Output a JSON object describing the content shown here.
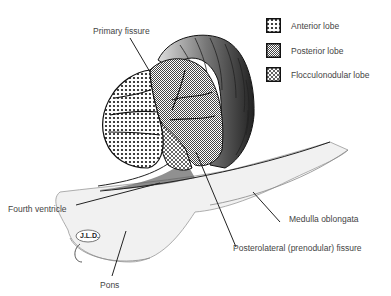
{
  "legend": {
    "items": [
      {
        "label": "Anterior lobe",
        "pattern": "dots"
      },
      {
        "label": "Posterior lobe",
        "pattern": "fine-hatch"
      },
      {
        "label": "Flocculonodular lobe",
        "pattern": "crosshatch"
      }
    ]
  },
  "labels": {
    "primary_fissure": "Primary fissure",
    "fourth_ventricle": "Fourth ventricle",
    "medulla_oblongata": "Medulla oblongata",
    "posterolateral_fissure": "Posterolateral (prenodular) fissure",
    "pons": "Pons",
    "signature": "J.L.D."
  },
  "colors": {
    "ink": "#111111",
    "brainstem_fill": "#f1f1f1",
    "label_text": "#444444"
  }
}
